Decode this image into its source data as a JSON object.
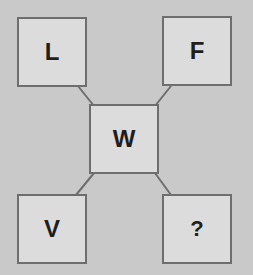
{
  "diagram": {
    "type": "letter-puzzle",
    "colors": {
      "background": "#c9c9c9",
      "box_fill": "#dcdcdc",
      "box_border": "#6e6e6e",
      "text": "#1e1e1e",
      "connector": "#6e6e6e"
    },
    "center": {
      "label": "W"
    },
    "corners": {
      "top_left": {
        "label": "L"
      },
      "top_right": {
        "label": "F"
      },
      "bottom_left": {
        "label": "V"
      },
      "bottom_right": {
        "label": "?"
      }
    }
  }
}
